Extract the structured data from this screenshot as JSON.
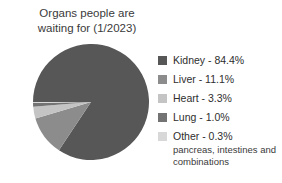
{
  "chart_data": {
    "type": "pie",
    "title": "Organs people are\nwaiting for (1/2023)",
    "categories": [
      "Kidney",
      "Liver",
      "Heart",
      "Lung",
      "Other"
    ],
    "values": [
      84.4,
      11.1,
      3.3,
      1.0,
      0.3
    ],
    "value_unit": "%",
    "colors": [
      "#575757",
      "#8c8c8c",
      "#c4c4c4",
      "#737373",
      "#d8d8d8"
    ],
    "legend_position": "right",
    "grid": false,
    "start_angle_deg": 180,
    "direction": "clockwise",
    "annotations": [
      "pancreas, intestines and combinations"
    ],
    "legend": [
      {
        "label": "Kidney - 84.4%",
        "color": "#575757",
        "note": ""
      },
      {
        "label": "Liver - 11.1%",
        "color": "#8c8c8c",
        "note": ""
      },
      {
        "label": "Heart - 3.3%",
        "color": "#c4c4c4",
        "note": ""
      },
      {
        "label": "Lung - 1.0%",
        "color": "#737373",
        "note": ""
      },
      {
        "label": "Other - 0.3%",
        "color": "#d8d8d8",
        "note": "pancreas, intestines and\ncombinations"
      }
    ]
  }
}
